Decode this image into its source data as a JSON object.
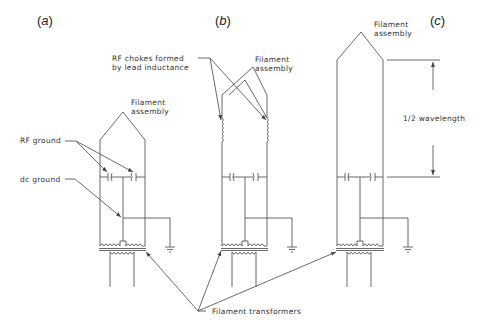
{
  "panels": [
    {
      "id": "a",
      "label_open": "(",
      "label_letter": "a",
      "label_close": ")"
    },
    {
      "id": "b",
      "label_open": "(",
      "label_letter": "b",
      "label_close": ")"
    },
    {
      "id": "c",
      "label_open": "(",
      "label_letter": "c",
      "label_close": ")"
    }
  ],
  "labels": {
    "filament_assembly_a_1": "Filament",
    "filament_assembly_a_2": "assembly",
    "filament_assembly_b_1": "Filament",
    "filament_assembly_b_2": "assembly",
    "filament_assembly_c_1": "Filament",
    "filament_assembly_c_2": "assembly",
    "rf_ground": "RF ground",
    "dc_ground": "dc ground",
    "rf_chokes_1": "RF chokes formed",
    "rf_chokes_2": "by lead inductance",
    "half_wavelength": "1/2 wavelength",
    "filament_transformers": "Filament transformers"
  },
  "colors": {
    "line": "#444444",
    "text": "#333333",
    "background": "#ffffff"
  }
}
